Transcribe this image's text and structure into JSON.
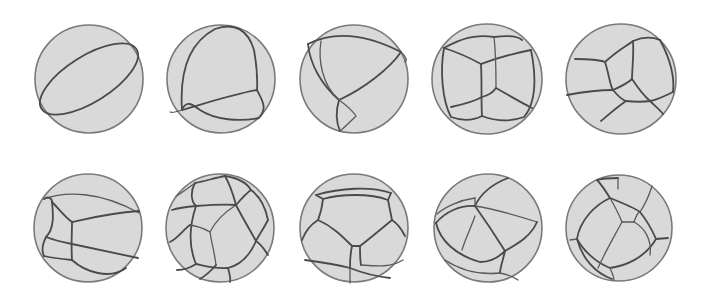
{
  "figure": {
    "rows": 2,
    "columns": 5,
    "colors": {
      "background": "#ffffff",
      "sphere_fill": "#d9d9d9",
      "sphere_outline": "#7a7a7a",
      "edge": "#4a4a4a"
    },
    "spheres": [
      {
        "id": "r1c1",
        "row": 1,
        "col": 1,
        "cx": 89,
        "cy": 79,
        "r": 54
      },
      {
        "id": "r1c2",
        "row": 1,
        "col": 2,
        "cx": 221,
        "cy": 79,
        "r": 54
      },
      {
        "id": "r1c3",
        "row": 1,
        "col": 3,
        "cx": 354,
        "cy": 79,
        "r": 54
      },
      {
        "id": "r1c4",
        "row": 1,
        "col": 4,
        "cx": 487,
        "cy": 79,
        "r": 55
      },
      {
        "id": "r1c5",
        "row": 1,
        "col": 5,
        "cx": 621,
        "cy": 79,
        "r": 55
      },
      {
        "id": "r2c1",
        "row": 2,
        "col": 1,
        "cx": 88,
        "cy": 228,
        "r": 54
      },
      {
        "id": "r2c2",
        "row": 2,
        "col": 2,
        "cx": 220,
        "cy": 228,
        "r": 54
      },
      {
        "id": "r2c3",
        "row": 2,
        "col": 3,
        "cx": 354,
        "cy": 228,
        "r": 54
      },
      {
        "id": "r2c4",
        "row": 2,
        "col": 4,
        "cx": 488,
        "cy": 228,
        "r": 54
      },
      {
        "id": "r2c5",
        "row": 2,
        "col": 5,
        "cx": 619,
        "cy": 228,
        "r": 53
      }
    ]
  }
}
